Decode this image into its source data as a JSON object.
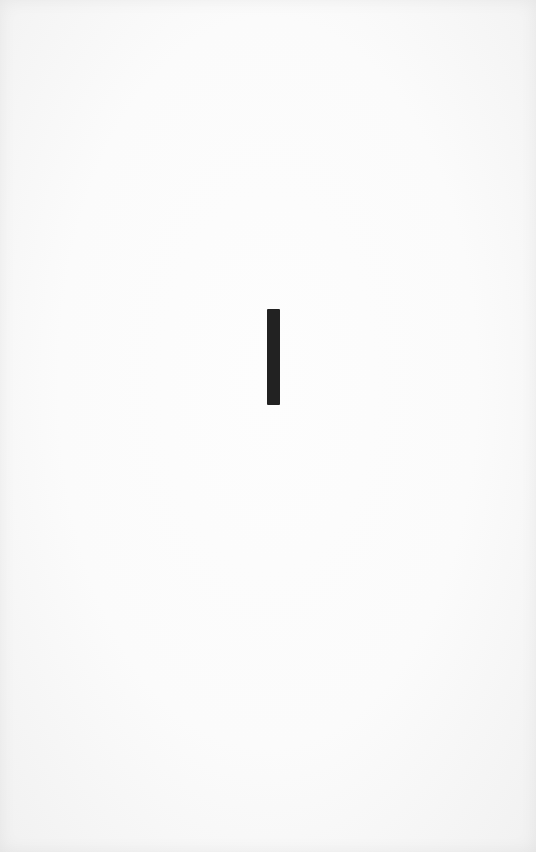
{
  "page": {
    "background_color": "#fbfbfb",
    "edge_shade_color": "#f1f1f1"
  },
  "mark": {
    "shape": "vertical-bar",
    "color": "#222222",
    "x": 267,
    "y": 309,
    "width": 13,
    "height": 96
  }
}
